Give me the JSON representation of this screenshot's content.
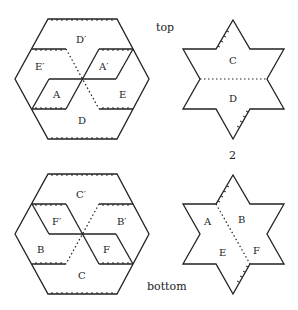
{
  "captions": {
    "top": "top",
    "bottom": "bottom",
    "step_top": "2",
    "step_label": "2"
  },
  "top_hexagon": {
    "labels": {
      "D_prime": "D′",
      "E_prime": "E′",
      "A_prime": "A′",
      "A": "A",
      "E": "E",
      "D": "D"
    }
  },
  "top_star": {
    "labels": {
      "C": "C",
      "D": "D"
    }
  },
  "bottom_hexagon": {
    "labels": {
      "C_prime": "C′",
      "F_prime": "F′",
      "B_prime": "B′",
      "B": "B",
      "F": "F",
      "C": "C"
    }
  },
  "bottom_star": {
    "labels": {
      "A": "A",
      "B": "B",
      "E": "E",
      "F": "F"
    }
  }
}
